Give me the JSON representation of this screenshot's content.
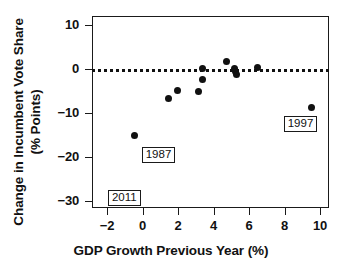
{
  "chart_data": {
    "type": "scatter",
    "title": "",
    "xlabel": "GDP Growth Previous Year (%)",
    "ylabel": "Change in Incumbent Vote Share (% Points)",
    "xlim": [
      -2.85,
      10.5
    ],
    "ylim": [
      -31.5,
      12.0
    ],
    "xticks": [
      -2,
      0,
      2,
      4,
      6,
      8,
      10
    ],
    "xticklabels": [
      "−2",
      "0",
      "2",
      "4",
      "6",
      "8",
      "10"
    ],
    "yticks": [
      10,
      0,
      -10,
      -20,
      -30
    ],
    "yticklabels": [
      "10",
      "0",
      "−10",
      "−20",
      "−30"
    ],
    "grid": false,
    "legend": null,
    "reference_line": {
      "orientation": "horizontal",
      "value": 0,
      "style": "dotted",
      "color": "#111111"
    },
    "points": [
      {
        "x": -0.45,
        "y": -15.0
      },
      {
        "x": -0.4,
        "y": -29.8
      },
      {
        "x": 1.45,
        "y": -6.8
      },
      {
        "x": 1.95,
        "y": -4.9
      },
      {
        "x": 3.15,
        "y": -5.2
      },
      {
        "x": 3.35,
        "y": 0.1
      },
      {
        "x": 3.35,
        "y": -2.3
      },
      {
        "x": 4.75,
        "y": 1.6
      },
      {
        "x": 5.15,
        "y": 0.1
      },
      {
        "x": 5.25,
        "y": -0.6
      },
      {
        "x": 5.3,
        "y": -1.3
      },
      {
        "x": 6.5,
        "y": 0.4
      },
      {
        "x": 9.5,
        "y": -8.8
      }
    ],
    "annotations": [
      {
        "label": "1987",
        "x": -0.05,
        "y": -17.6
      },
      {
        "label": "2011",
        "x": -1.95,
        "y": -27.4
      },
      {
        "label": "1997",
        "x": 7.95,
        "y": -10.6
      }
    ]
  }
}
